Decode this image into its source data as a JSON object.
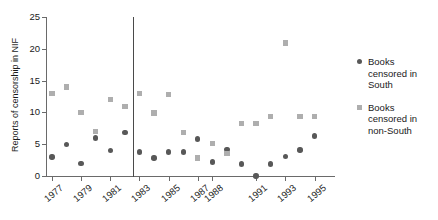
{
  "chart_data": {
    "type": "scatter",
    "title": "",
    "xlabel": "",
    "ylabel": "Reports of censorship in NIF",
    "ylim": [
      0,
      25
    ],
    "yticks": [
      0,
      5,
      10,
      15,
      20,
      25
    ],
    "xticks": [
      1977,
      1979,
      1981,
      1983,
      1985,
      1987,
      1988,
      1991,
      1993,
      1995
    ],
    "grid": false,
    "legend_position": "right",
    "annotations": [
      {
        "name": "vertical-reference-line",
        "x": 1982,
        "label": ""
      }
    ],
    "x": [
      1977,
      1978,
      1979,
      1980,
      1981,
      1982,
      1983,
      1984,
      1985,
      1986,
      1987,
      1988,
      1989,
      1990,
      1991,
      1992,
      1993,
      1994,
      1995
    ],
    "series": [
      {
        "name": "Books censored in South",
        "marker": "circle",
        "color": "#585858",
        "values": [
          3,
          5,
          2,
          6,
          4,
          6.8,
          3.8,
          2.8,
          3.8,
          3.8,
          5.8,
          2.2,
          4.2,
          1.9,
          0,
          1.9,
          3.1,
          4.1,
          6.3
        ]
      },
      {
        "name": "Books censored in non-South",
        "marker": "square",
        "color": "#aeaeae",
        "values": [
          13,
          14,
          10,
          7,
          12,
          10.9,
          13,
          9.9,
          12.8,
          6.8,
          2.8,
          5.1,
          3.5,
          8.3,
          8.3,
          9.4,
          20.9,
          9.4,
          9.4
        ]
      }
    ]
  },
  "axes": {
    "y_title": "Reports of censorship in NIF",
    "y_tick_labels": [
      "0",
      "5",
      "10",
      "15",
      "20",
      "25"
    ],
    "x_tick_labels": [
      "1977",
      "1979",
      "1981",
      "1983",
      "1985",
      "1987",
      "1988",
      "1991",
      "1993",
      "1995"
    ]
  },
  "legend": {
    "entries": [
      {
        "label": "Books censored in South",
        "marker": "circle",
        "color": "#585858"
      },
      {
        "label": "Books censored in non-South",
        "marker": "square",
        "color": "#aeaeae"
      }
    ]
  }
}
